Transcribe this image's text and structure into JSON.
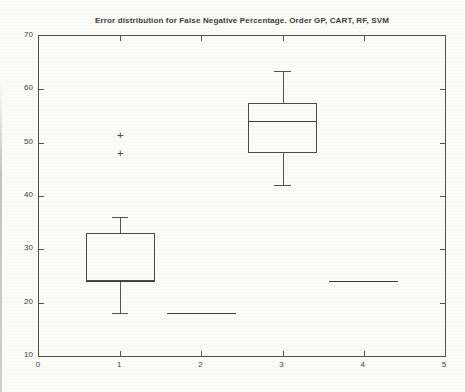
{
  "chart_data": {
    "type": "boxplot",
    "title": "Error distribution for False Negative Percentage. Order GP, CART, RF, SVM",
    "xlabel": "",
    "ylabel": "",
    "xlim": [
      0,
      5
    ],
    "ylim": [
      10,
      70
    ],
    "xticks": [
      0,
      1,
      2,
      3,
      4,
      5
    ],
    "yticks": [
      10,
      20,
      30,
      40,
      50,
      60,
      70
    ],
    "grid": "off",
    "legend": "none",
    "tick_direction": "in",
    "box_width_units": 0.85,
    "cap_width_units": 0.2,
    "groups": [
      {
        "name": "GP",
        "x": 1,
        "whisker_low": 18,
        "q1": 24,
        "median": 24,
        "q3": 33,
        "whisker_high": 36,
        "outliers": [
          48,
          51.5
        ]
      },
      {
        "name": "CART",
        "x": 2,
        "whisker_low": 18,
        "q1": 18,
        "median": 18,
        "q3": 18,
        "whisker_high": 18,
        "outliers": []
      },
      {
        "name": "RF",
        "x": 3,
        "whisker_low": 42,
        "q1": 48,
        "median": 54,
        "q3": 57.5,
        "whisker_high": 63.5,
        "outliers": []
      },
      {
        "name": "SVM",
        "x": 4,
        "whisker_low": 24,
        "q1": 24,
        "median": 24,
        "q3": 24,
        "whisker_high": 24,
        "outliers": []
      }
    ],
    "colors": {
      "line": "#545454",
      "box": "#4a4a4a",
      "median": "#3c3c3c",
      "text": "#3d3d3d",
      "background": "#fbfbf8"
    },
    "outlier_marker": "plus-marker"
  }
}
